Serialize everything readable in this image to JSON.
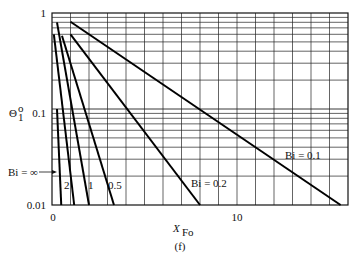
{
  "figure": {
    "caption": "(f)"
  },
  "chart_data": {
    "type": "line",
    "title": "",
    "xlabel": "X",
    "xlabel_sub": "Fo",
    "ylabel": "Θ",
    "ylabel_sup": "o",
    "ylabel_sub": "1",
    "xscale": "linear",
    "yscale": "log",
    "xlim": [
      0,
      16
    ],
    "ylim": [
      0.01,
      1
    ],
    "x_ticks": [
      0,
      10
    ],
    "x_tick_labels": [
      "0",
      "10"
    ],
    "y_ticks": [
      1,
      0.1,
      0.01
    ],
    "y_tick_labels": [
      "1",
      "0.1",
      "0.01"
    ],
    "grid": true,
    "legend": "none (inline labels)",
    "series": [
      {
        "name": "Bi = ∞",
        "label": "Bi = ∞",
        "x": [
          0.27,
          0.5
        ],
        "y": [
          0.1,
          0.01
        ]
      },
      {
        "name": "Bi = 2",
        "label": "2",
        "x": [
          0.1,
          1.2
        ],
        "y": [
          0.6,
          0.01
        ]
      },
      {
        "name": "Bi = 1",
        "label": "1",
        "x": [
          0.27,
          2.0
        ],
        "y": [
          0.8,
          0.01
        ]
      },
      {
        "name": "Bi = 0.5",
        "label": "0.5",
        "x": [
          0.54,
          3.35
        ],
        "y": [
          0.58,
          0.01
        ]
      },
      {
        "name": "Bi = 0.2",
        "label": "Bi = 0.2",
        "x": [
          1.0,
          8.0
        ],
        "y": [
          0.6,
          0.01
        ]
      },
      {
        "name": "Bi = 0.1",
        "label": "Bi = 0.1",
        "x": [
          1.0,
          15.6
        ],
        "y": [
          0.81,
          0.01
        ]
      }
    ],
    "annotations": [
      {
        "text": "Bi = ∞",
        "arrow_to": "Bi = ∞ curve"
      },
      {
        "text": "2"
      },
      {
        "text": "1"
      },
      {
        "text": "0.5"
      },
      {
        "text": "Bi = 0.2"
      },
      {
        "text": "Bi = 0.1"
      }
    ]
  }
}
